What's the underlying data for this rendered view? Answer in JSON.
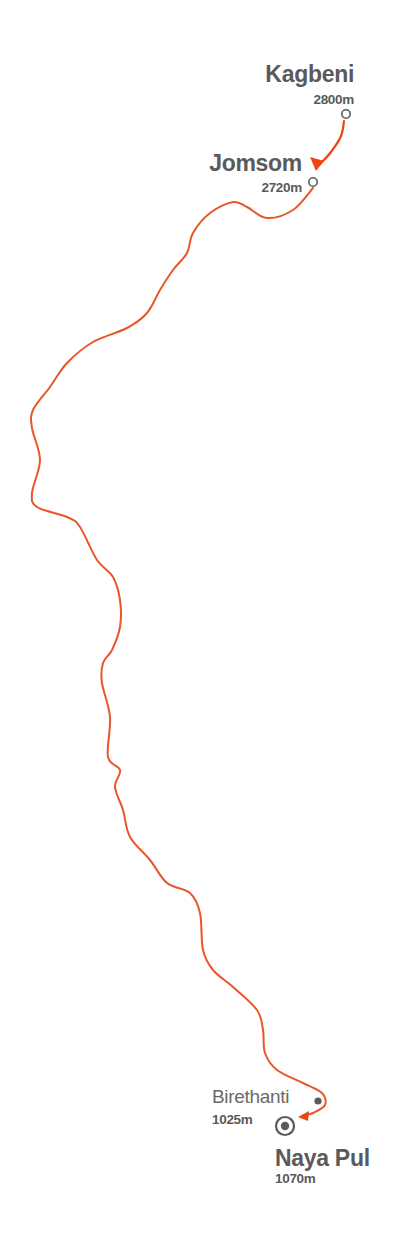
{
  "colors": {
    "route": "#e8562a",
    "arrow": "#f04414",
    "text": "#5a5a5a",
    "marker": "#5a5a5a",
    "background": "#ffffff"
  },
  "stops": [
    {
      "id": "kagbeni",
      "name": "Kagbeni",
      "elevation": "2800m",
      "marker": "open-circle",
      "x": 346,
      "y": 114
    },
    {
      "id": "jomsom",
      "name": "Jomsom",
      "elevation": "2720m",
      "marker": "open-circle",
      "x": 313,
      "y": 182
    },
    {
      "id": "birethanti",
      "name": "Birethanti",
      "elevation": "1025m",
      "marker": "filled-dot",
      "x": 318,
      "y": 1101
    },
    {
      "id": "naya-pul",
      "name": "Naya Pul",
      "elevation": "1070m",
      "marker": "target",
      "x": 285,
      "y": 1126
    }
  ],
  "route": {
    "connector_kagbeni_jomsom": [
      [
        344,
        121
      ],
      [
        341,
        136
      ],
      [
        331,
        152
      ],
      [
        320,
        164
      ]
    ],
    "main_path": [
      [
        313,
        188
      ],
      [
        293,
        210
      ],
      [
        267,
        218
      ],
      [
        247,
        207
      ],
      [
        233,
        202
      ],
      [
        210,
        213
      ],
      [
        193,
        233
      ],
      [
        187,
        253
      ],
      [
        173,
        270
      ],
      [
        160,
        290
      ],
      [
        147,
        313
      ],
      [
        127,
        328
      ],
      [
        93,
        342
      ],
      [
        67,
        363
      ],
      [
        50,
        387
      ],
      [
        33,
        410
      ],
      [
        32,
        428
      ],
      [
        40,
        460
      ],
      [
        32,
        493
      ],
      [
        37,
        507
      ],
      [
        67,
        517
      ],
      [
        80,
        527
      ],
      [
        97,
        560
      ],
      [
        113,
        577
      ],
      [
        120,
        600
      ],
      [
        120,
        627
      ],
      [
        112,
        650
      ],
      [
        103,
        663
      ],
      [
        102,
        683
      ],
      [
        110,
        717
      ],
      [
        108,
        757
      ],
      [
        120,
        770
      ],
      [
        115,
        787
      ],
      [
        123,
        810
      ],
      [
        130,
        837
      ],
      [
        150,
        860
      ],
      [
        167,
        883
      ],
      [
        190,
        893
      ],
      [
        200,
        913
      ],
      [
        203,
        950
      ],
      [
        213,
        970
      ],
      [
        233,
        987
      ],
      [
        257,
        1010
      ],
      [
        263,
        1030
      ],
      [
        265,
        1053
      ],
      [
        277,
        1070
      ],
      [
        303,
        1083
      ],
      [
        322,
        1093
      ],
      [
        325,
        1105
      ],
      [
        313,
        1113
      ],
      [
        303,
        1116
      ]
    ]
  }
}
